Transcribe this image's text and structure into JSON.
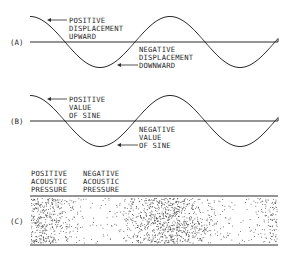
{
  "colors": {
    "ink": "#2a2a2a",
    "background": "#ffffff"
  },
  "panels": {
    "a": {
      "label": "(A)",
      "annotation_positive": [
        "POSITIVE",
        "DISPLACEMENT",
        "UPWARD"
      ],
      "annotation_negative": [
        "NEGATIVE",
        "DISPLACEMENT",
        "DOWNWARD"
      ]
    },
    "b": {
      "label": "(B)",
      "annotation_positive": [
        "POSITIVE",
        "VALUE",
        "OF SINE"
      ],
      "annotation_negative": [
        "NEGATIVE",
        "VALUE",
        "OF SINE"
      ]
    },
    "c": {
      "label": "(C)",
      "heading_positive": [
        "POSITIVE",
        "ACOUSTIC",
        "PRESSURE"
      ],
      "heading_negative": [
        "NEGATIVE",
        "ACOUSTIC",
        "PRESSURE"
      ],
      "dot_field": {
        "x0": 31,
        "x1": 277,
        "y0": 198,
        "y1": 243,
        "count": 1500,
        "seed": 7,
        "wave_period": 138,
        "wave_phase_x": 30
      }
    }
  }
}
